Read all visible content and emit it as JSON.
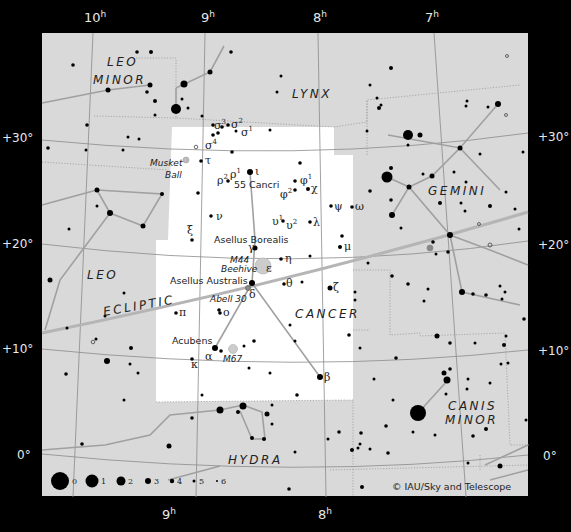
{
  "map": {
    "title": "Cancer constellation star chart",
    "credit": "© IAU/Sky and Telescope",
    "colors": {
      "background": "#000000",
      "sky_area": "#d9d9d9",
      "highlight_area": "#ffffff",
      "stars": "#000000",
      "labels": "#222222",
      "axis_labels": "#e8e8e8"
    },
    "ra_labels_top": [
      {
        "h": "10",
        "sup": "h"
      },
      {
        "h": "9",
        "sup": "h"
      },
      {
        "h": "8",
        "sup": "h"
      },
      {
        "h": "7",
        "sup": "h"
      }
    ],
    "ra_labels_bottom": [
      {
        "h": "9",
        "sup": "h"
      },
      {
        "h": "8",
        "sup": "h"
      }
    ],
    "dec_labels_left": [
      "+30°",
      "+20°",
      "+10°",
      "0°"
    ],
    "dec_labels_right": [
      "+30°",
      "+20°",
      "+10°",
      "0°"
    ],
    "constellations": {
      "leo_minor": [
        "LEO",
        "MINOR"
      ],
      "lynx": "LYNX",
      "gemini": "GEMINI",
      "leo": "LEO",
      "cancer": "CANCER",
      "canis_minor": [
        "CANIS",
        "MINOR"
      ],
      "hydra": "HYDRA"
    },
    "ecliptic_label": "ECLIPTIC",
    "star_labels": {
      "sigma3": "σ",
      "sigma3_sup": "3",
      "sigma2": "σ",
      "sigma2_sup": "2",
      "sigma1": "σ",
      "sigma1_sup": "1",
      "sigma4": "σ",
      "sigma4_sup": "4",
      "tau": "τ",
      "rho2": "ρ",
      "rho2_sup": "2",
      "rho1": "ρ",
      "rho1_sup": "1",
      "iota": "ι",
      "phi1": "φ",
      "phi1_sup": "1",
      "phi2": "φ",
      "phi2_sup": "2",
      "chi": "χ",
      "psi": "ψ",
      "omega": "ω",
      "nu": "ν",
      "xi": "ξ",
      "upsilon1": "υ",
      "upsilon1_sup": "1",
      "upsilon2": "υ",
      "upsilon2_sup": "2",
      "lambda": "λ",
      "mu": "μ",
      "gamma": "γ",
      "eta": "η",
      "epsilon": "ε",
      "delta": "δ",
      "theta": "θ",
      "zeta": "ζ",
      "pi": "π",
      "omicron": "ο",
      "alpha": "α",
      "kappa": "κ",
      "beta": "β"
    },
    "object_labels": {
      "musket_ball_1": "Musket",
      "musket_ball_2": "Ball",
      "cancri55": "55 Cancri",
      "asellus_borealis": "Asellus Borealis",
      "m44": "M44",
      "beehive": "Beehive",
      "asellus_australis": "Asellus Australis",
      "abell30": "Abell 30",
      "acubens": "Acubens",
      "m67": "M67"
    },
    "legend": {
      "magnitudes": [
        "0",
        "1",
        "2",
        "3",
        "4",
        "5",
        "6"
      ]
    }
  }
}
